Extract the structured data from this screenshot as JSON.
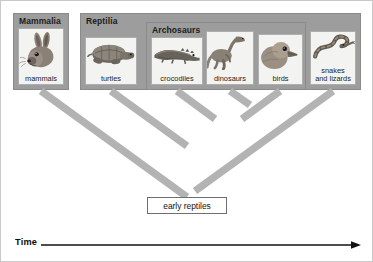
{
  "diagram": {
    "type": "cladogram",
    "root_label": "early reptiles",
    "axis": {
      "label": "Time",
      "direction": "left-to-right",
      "arrow": "right-arrow-icon"
    },
    "groups": [
      {
        "id": "mammalia",
        "label": "Mammalia",
        "members": [
          "mammals"
        ]
      },
      {
        "id": "reptilia",
        "label": "Reptilia",
        "members": [
          "turtles",
          "crocodiles",
          "dinosaurs",
          "birds",
          "snakes and lizards"
        ]
      },
      {
        "id": "archosaurs",
        "label": "Archosaurs",
        "members": [
          "crocodiles",
          "dinosaurs",
          "birds"
        ]
      }
    ],
    "taxa": [
      {
        "id": "mammals",
        "label": "mammals",
        "icon": "rabbit-icon"
      },
      {
        "id": "turtles",
        "label": "turtles",
        "icon": "turtle-icon"
      },
      {
        "id": "crocodiles",
        "label": "crocodiles",
        "icon": "crocodile-icon"
      },
      {
        "id": "dinosaurs",
        "label": "dinosaurs",
        "icon": "dinosaur-icon"
      },
      {
        "id": "birds",
        "label": "birds",
        "icon": "bird-icon"
      },
      {
        "id": "snakes-and-lizards",
        "label": "snakes\nand lizards",
        "icon": "snake-icon"
      }
    ],
    "colors": {
      "group_fill": "#9d9d9d",
      "group_border": "#8a8a8a",
      "card_fill": "#f3f3f1",
      "card_border": "#aeaeae",
      "branch": "#b3b3b3",
      "axis": "#111111",
      "text": "#1c1c1c"
    }
  }
}
